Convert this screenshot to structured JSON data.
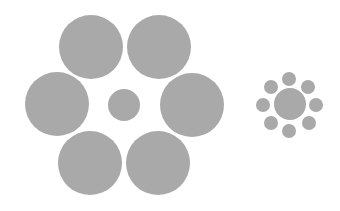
{
  "diagram": {
    "name": "Ebbinghaus illusion",
    "fill_color": "#a9a9a9",
    "background": "#ffffff",
    "groups": [
      {
        "id": "large-surround",
        "center": {
          "cx": 124,
          "cy": 105,
          "r": 16
        },
        "surround": [
          {
            "cx": 91,
            "cy": 47,
            "r": 32
          },
          {
            "cx": 159,
            "cy": 47,
            "r": 32
          },
          {
            "cx": 57,
            "cy": 104,
            "r": 32
          },
          {
            "cx": 192,
            "cy": 105,
            "r": 32
          },
          {
            "cx": 90,
            "cy": 163,
            "r": 32
          },
          {
            "cx": 158,
            "cy": 163,
            "r": 32
          }
        ]
      },
      {
        "id": "small-surround",
        "center": {
          "cx": 290,
          "cy": 104,
          "r": 16
        },
        "surround": [
          {
            "cx": 289,
            "cy": 79,
            "r": 7
          },
          {
            "cx": 308,
            "cy": 87,
            "r": 7
          },
          {
            "cx": 316,
            "cy": 105,
            "r": 7
          },
          {
            "cx": 309,
            "cy": 123,
            "r": 7
          },
          {
            "cx": 289,
            "cy": 131,
            "r": 7
          },
          {
            "cx": 271,
            "cy": 123,
            "r": 7
          },
          {
            "cx": 263,
            "cy": 105,
            "r": 7
          },
          {
            "cx": 271,
            "cy": 87,
            "r": 7
          }
        ]
      }
    ]
  }
}
